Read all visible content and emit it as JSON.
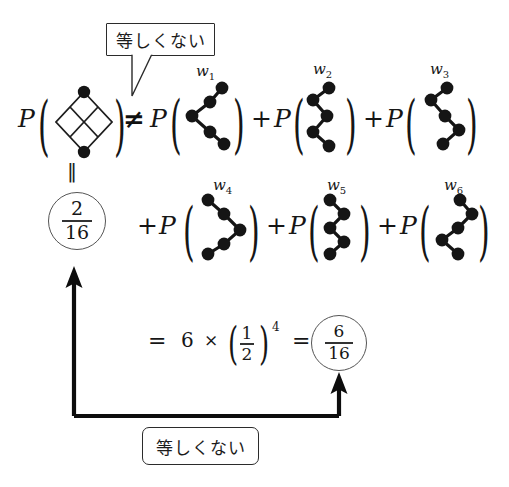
{
  "figure": {
    "title_equation": "P(lattice) != P(w1) + P(w2) + P(w3) + P(w4) + P(w5) + P(w6)",
    "P_symbol": "P",
    "not_equal_symbol": "≠",
    "plus_symbol": "+",
    "equals_symbol": "=",
    "times_symbol": "×",
    "double_bar_symbol": "‖",
    "open_paren": "(",
    "close_paren": ")"
  },
  "callouts": {
    "top": {
      "text": "等しくない",
      "meaning": "not equal"
    },
    "bottom": {
      "text": "等しくない",
      "meaning": "not equal"
    }
  },
  "row1": {
    "lhs": {
      "p": "P",
      "open": "(",
      "close": ")",
      "graph_name": "lattice-diamond"
    },
    "relation": "≠",
    "terms": [
      {
        "p": "P",
        "open": "(",
        "close": ")",
        "label": "w",
        "sub": "1",
        "graph_name": "walk-w1"
      },
      {
        "op": "+",
        "p": "P",
        "open": "(",
        "close": ")",
        "label": "w",
        "sub": "2",
        "graph_name": "walk-w2"
      },
      {
        "op": "+",
        "p": "P",
        "open": "(",
        "close": ")",
        "label": "w",
        "sub": "3",
        "graph_name": "walk-w3"
      }
    ]
  },
  "row2": {
    "double_bar": "‖",
    "circled_value": {
      "numerator": "2",
      "denominator": "16"
    },
    "terms": [
      {
        "op": "+",
        "p": "P",
        "open": "(",
        "close": ")",
        "label": "w",
        "sub": "4",
        "graph_name": "walk-w4"
      },
      {
        "op": "+",
        "p": "P",
        "open": "(",
        "close": ")",
        "label": "w",
        "sub": "5",
        "graph_name": "walk-w5"
      },
      {
        "op": "+",
        "p": "P",
        "open": "(",
        "close": ")",
        "label": "w",
        "sub": "6",
        "graph_name": "walk-w6"
      }
    ]
  },
  "row3": {
    "equals_1": "=",
    "count": "6",
    "times": "×",
    "open": "(",
    "close": ")",
    "base": {
      "numerator": "1",
      "denominator": "2"
    },
    "exponent": "4",
    "equals_2": "=",
    "circled_value": {
      "numerator": "6",
      "denominator": "16"
    }
  },
  "colors": {
    "node_fill": "#151515",
    "edge_stroke": "#151515",
    "lattice_stroke": "#1d1d1d",
    "text": "#161616",
    "box_border": "#2b2b2b",
    "circle_border": "#555555",
    "arrow": "#0d0d0d",
    "background": "#ffffff"
  }
}
